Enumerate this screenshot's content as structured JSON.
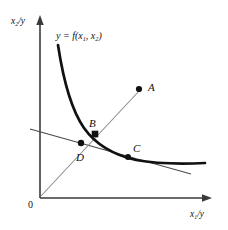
{
  "figure": {
    "type": "diagram",
    "background_color": "#ffffff",
    "ink_color": "#111111",
    "thin_line_color": "#555555",
    "axes": {
      "origin_label": "0",
      "y_axis_label_main": "x",
      "y_axis_label_sub": "2",
      "y_axis_label_tail": "/y",
      "x_axis_label_main": "x",
      "x_axis_label_sub": "1",
      "x_axis_label_tail": "/y"
    },
    "curve": {
      "label_prefix": "y = f(x",
      "label_sub1": "1",
      "label_mid": ", x",
      "label_sub2": "2",
      "label_suffix": ")",
      "style": "thick convex decreasing isoquant"
    },
    "points": [
      {
        "id": "A",
        "label": "A",
        "x": 139,
        "y": 89,
        "marker": "filled-dot",
        "on": "ray"
      },
      {
        "id": "B",
        "label": "B",
        "x": 95,
        "y": 134,
        "marker": "filled-square",
        "on": "curve-and-ray"
      },
      {
        "id": "C",
        "label": "C",
        "x": 128,
        "y": 157,
        "marker": "filled-dot",
        "on": "curve-tangent"
      },
      {
        "id": "D",
        "label": "D",
        "x": 81,
        "y": 143,
        "marker": "filled-dot",
        "on": "ray-and-isocost"
      }
    ],
    "lines": [
      {
        "name": "expansion-ray",
        "from": "origin",
        "through": [
          "D",
          "B"
        ],
        "to": "A",
        "style": "thin"
      },
      {
        "name": "isocost-tangent",
        "from": "y-axis",
        "through": [
          "D",
          "C"
        ],
        "style": "thin"
      }
    ]
  }
}
